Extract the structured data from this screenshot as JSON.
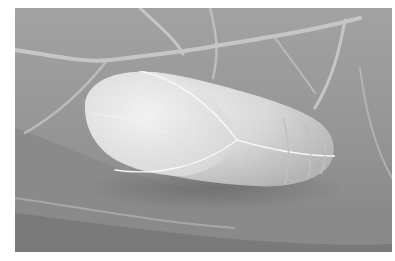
{
  "image": {
    "alt": "Grayscale close-up photograph of a pale pupa (chrysalis) resting on a veined leaf",
    "subject": "pupa",
    "background": "leaf-with-veins",
    "palette": {
      "leaf_dark": "#7d7d7d",
      "leaf_mid": "#959595",
      "leaf_light": "#a8a8a8",
      "vein": "#c4c4c4",
      "pupa_light": "#ebebeb",
      "pupa_mid": "#d2d2d2",
      "pupa_shadow": "#b0b0b0",
      "frame": "#ffffff"
    }
  }
}
